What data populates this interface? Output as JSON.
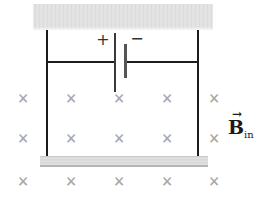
{
  "battery": {
    "positive_label": "+",
    "negative_label": "−"
  },
  "field_label": {
    "arrow": "→",
    "symbol": "B",
    "subscript": "in"
  },
  "field": {
    "cross_symbol": "×",
    "rows": [
      98,
      138,
      181
    ],
    "cols": [
      23,
      71,
      119,
      167,
      214
    ]
  },
  "colors": {
    "wire": "#1c1c1c",
    "battery_plate_long": "#3a3a3a",
    "battery_plate_short": "#555555",
    "field_cross": "#a9a9a9",
    "label_ink": "#1a1a1a",
    "ceiling_gray": "#d6d6d6",
    "rod_gray": "#d4d4d4"
  }
}
